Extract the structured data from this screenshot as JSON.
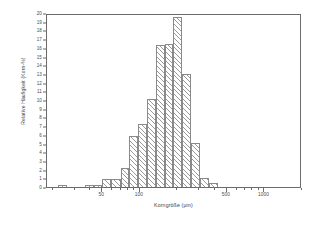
{
  "chart_data": {
    "type": "bar",
    "title": "",
    "subtitle": "",
    "xlabel": "Korngröße (µm)",
    "ylabel": "Relative Häufigkeit (Korn-%)",
    "xscale": "log",
    "yscale": "linear",
    "xlim": [
      18,
      2000
    ],
    "ylim": [
      0,
      20
    ],
    "grid": false,
    "legend": null,
    "annotations": [],
    "y_ticks": [
      0,
      1,
      2,
      3,
      4,
      5,
      6,
      7,
      8,
      9,
      10,
      11,
      12,
      13,
      14,
      15,
      16,
      17,
      18,
      19,
      20
    ],
    "y_tick_labels": [
      "0",
      "1",
      "2",
      "3",
      "4",
      "5",
      "6",
      "7",
      "8",
      "9",
      "10",
      "11",
      "12",
      "13",
      "14",
      "15",
      "16",
      "17",
      "18",
      "19",
      "20"
    ],
    "x_major_ticks": [
      50,
      100,
      500,
      1000
    ],
    "x_major_tick_labels": [
      "50",
      "100",
      "500",
      "1000"
    ],
    "x_minor_ticks": [
      20,
      30,
      40,
      60,
      70,
      80,
      90,
      200,
      300,
      400,
      600,
      700,
      800,
      900,
      2000
    ],
    "bar_edges_um": [
      22,
      26,
      31,
      36,
      43,
      50,
      59,
      70,
      82,
      97,
      114,
      134,
      158,
      186,
      219,
      258,
      304,
      358,
      422,
      497,
      585,
      689,
      812,
      956
    ],
    "categories": [
      "22-26",
      "26-31",
      "31-36",
      "36-43",
      "43-50",
      "50-59",
      "59-70",
      "70-82",
      "82-97",
      "97-114",
      "114-134",
      "134-158",
      "158-186",
      "186-219",
      "219-258",
      "258-304",
      "304-358",
      "358-422",
      "422-497",
      "497-585",
      "585-689",
      "689-812",
      "812-956"
    ],
    "values": [
      0.2,
      0.0,
      0.0,
      0.2,
      0.2,
      0.9,
      0.9,
      2.2,
      5.9,
      7.2,
      10.1,
      16.3,
      16.4,
      19.5,
      13.0,
      5.1,
      1.0,
      0.5,
      0.0,
      0.0,
      0.0,
      0.0,
      0.0
    ],
    "bars": [
      {
        "left_um": 22,
        "right_um": 26,
        "value": 0.2
      },
      {
        "left_um": 36,
        "right_um": 43,
        "value": 0.2
      },
      {
        "left_um": 43,
        "right_um": 50,
        "value": 0.2
      },
      {
        "left_um": 50,
        "right_um": 59,
        "value": 0.9
      },
      {
        "left_um": 59,
        "right_um": 70,
        "value": 0.9
      },
      {
        "left_um": 70,
        "right_um": 82,
        "value": 2.2
      },
      {
        "left_um": 82,
        "right_um": 97,
        "value": 5.9
      },
      {
        "left_um": 97,
        "right_um": 114,
        "value": 7.2
      },
      {
        "left_um": 114,
        "right_um": 134,
        "value": 10.1
      },
      {
        "left_um": 134,
        "right_um": 158,
        "value": 16.3
      },
      {
        "left_um": 158,
        "right_um": 186,
        "value": 16.4
      },
      {
        "left_um": 186,
        "right_um": 219,
        "value": 19.5
      },
      {
        "left_um": 219,
        "right_um": 258,
        "value": 13.0
      },
      {
        "left_um": 258,
        "right_um": 304,
        "value": 5.1
      },
      {
        "left_um": 304,
        "right_um": 358,
        "value": 1.0
      },
      {
        "left_um": 358,
        "right_um": 422,
        "value": 0.5
      }
    ],
    "style": {
      "bar_fill": "hatched-45deg",
      "bar_edge_color": "#8a8a8a",
      "hatch_color": "#9a9a9a",
      "axis_color": "#6b6b6b",
      "text_color": "#3d3d3d",
      "background": "#ffffff"
    }
  }
}
